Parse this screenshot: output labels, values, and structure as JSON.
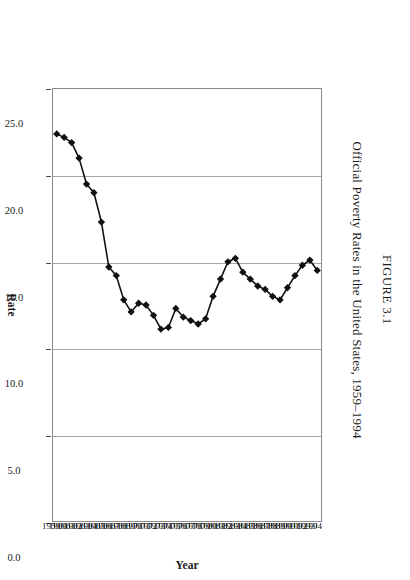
{
  "figure": {
    "number_label": "FIGURE 3.1",
    "caption": "Official Poverty Rates in the United States, 1959–1994"
  },
  "axes": {
    "value_axis_title": "Rate",
    "category_axis_title": "Year",
    "value_ticks": [
      "25.0",
      "20.0",
      "15.0",
      "10.0",
      "5.0",
      "0.0"
    ]
  },
  "style": {
    "line_color": "#111111",
    "marker_color": "#111111",
    "gridline_color": "#a7a7a7",
    "frame_color": "#8a8a8a",
    "background": "#ffffff"
  },
  "chart_data": {
    "type": "line",
    "title": "Official Poverty Rates in the United States, 1959–1994",
    "xlabel": "Year",
    "ylabel": "Rate",
    "orientation": "rotated-90-clockwise",
    "grid": true,
    "legend": "none",
    "ylim": [
      0.0,
      25.0
    ],
    "ytick_values": [
      25.0,
      20.0,
      15.0,
      10.0,
      5.0,
      0.0
    ],
    "categories": [
      "1959",
      "1960",
      "1961",
      "1962",
      "1963",
      "1964",
      "1965",
      "1966",
      "1967",
      "1968",
      "1969",
      "1970",
      "1971",
      "1972",
      "1973",
      "1974",
      "1975",
      "1976",
      "1977",
      "1978",
      "1979",
      "1980",
      "1981",
      "1982",
      "1983",
      "1984",
      "1985",
      "1986",
      "1987",
      "1988",
      "1989",
      "1990",
      "1991",
      "1992",
      "1993",
      "1994"
    ],
    "series": [
      {
        "name": "Official poverty rate",
        "values": [
          22.4,
          22.2,
          21.9,
          21.0,
          19.5,
          19.0,
          17.3,
          14.7,
          14.2,
          12.8,
          12.1,
          12.6,
          12.5,
          11.9,
          11.1,
          11.2,
          12.3,
          11.8,
          11.6,
          11.4,
          11.7,
          13.0,
          14.0,
          15.0,
          15.2,
          14.4,
          14.0,
          13.6,
          13.4,
          13.0,
          12.8,
          13.5,
          14.2,
          14.8,
          15.1,
          14.5
        ]
      }
    ]
  }
}
